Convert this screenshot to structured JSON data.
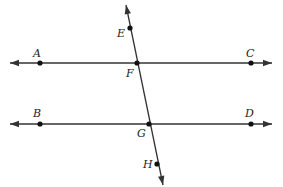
{
  "diagram": {
    "type": "geometry",
    "colors": {
      "line": "#333333",
      "point": "#111111",
      "label": "#222222",
      "background": "#ffffff"
    },
    "lines": [
      {
        "name": "line-AC",
        "from": [
          10,
          63
        ],
        "to": [
          272,
          63
        ],
        "arrows": "both"
      },
      {
        "name": "line-BD",
        "from": [
          10,
          124
        ],
        "to": [
          272,
          124
        ],
        "arrows": "both"
      },
      {
        "name": "transversal-EH",
        "from": [
          126,
          5
        ],
        "to": [
          163,
          185
        ],
        "arrows": "both"
      }
    ],
    "points": [
      {
        "id": "A",
        "label": "A",
        "x": 40,
        "y": 63,
        "lx": 33,
        "ly": 57
      },
      {
        "id": "C",
        "label": "C",
        "x": 251,
        "y": 63,
        "lx": 246,
        "ly": 57
      },
      {
        "id": "E",
        "label": "E",
        "x": 130,
        "y": 28,
        "lx": 117,
        "ly": 37
      },
      {
        "id": "F",
        "label": "F",
        "x": 137,
        "y": 63,
        "lx": 126,
        "ly": 77
      },
      {
        "id": "B",
        "label": "B",
        "x": 40,
        "y": 124,
        "lx": 33,
        "ly": 117
      },
      {
        "id": "D",
        "label": "D",
        "x": 251,
        "y": 124,
        "lx": 245,
        "ly": 117
      },
      {
        "id": "G",
        "label": "G",
        "x": 149,
        "y": 124,
        "lx": 137,
        "ly": 137
      },
      {
        "id": "H",
        "label": "H",
        "x": 157,
        "y": 164,
        "lx": 143,
        "ly": 168
      }
    ]
  }
}
